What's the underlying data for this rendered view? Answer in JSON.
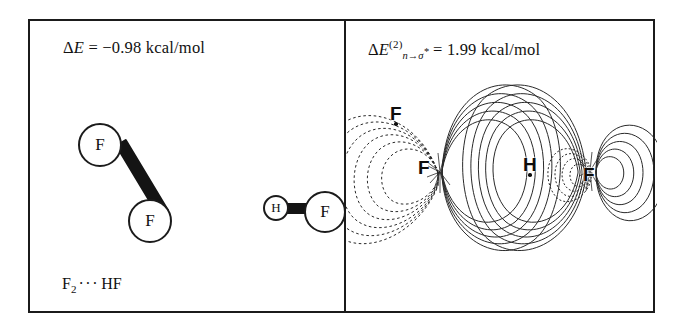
{
  "figure": {
    "system": "F2---HF",
    "panels": [
      {
        "id": "ball-and-stick",
        "energy_label": {
          "symbol": "E",
          "delta": "Δ",
          "equals": "=",
          "value": "−0.98",
          "units": "kcal/mol",
          "full_text": "ΔE = −0.98 kcal/mol"
        },
        "caption": {
          "formula_first": "F",
          "formula_sub": "2",
          "dots": "···",
          "formula_second": "HF",
          "full_text": "F2 ··· HF"
        },
        "molecules": [
          {
            "name": "difluorine",
            "atoms": [
              {
                "label": "F",
                "role": "fluorine-upper"
              },
              {
                "label": "F",
                "role": "fluorine-lower"
              }
            ],
            "bond": "single"
          },
          {
            "name": "hydrogen-fluoride",
            "atoms": [
              {
                "label": "H",
                "role": "hydrogen"
              },
              {
                "label": "F",
                "role": "fluorine"
              }
            ],
            "bond": "single"
          }
        ]
      },
      {
        "id": "orbital-overlap",
        "energy_label": {
          "delta": "Δ",
          "symbol": "E",
          "superscript": "(2)",
          "subscript_from": "n",
          "subscript_arrow": "→",
          "subscript_to": "σ",
          "subscript_star": "*",
          "equals": "=",
          "value": "1.99",
          "units": "kcal/mol",
          "full_text": "ΔE(2) n→σ* = 1.99 kcal/mol"
        },
        "atom_labels": [
          {
            "label": "F",
            "position": "upper-left-out-of-plane"
          },
          {
            "label": "F",
            "position": "left-donor"
          },
          {
            "label": "H",
            "position": "center"
          },
          {
            "label": "F",
            "position": "right-acceptor"
          }
        ],
        "contours": {
          "description": "NBO orbital overlap contour diagram",
          "positive_phase_style": "solid",
          "negative_phase_style": "dashed",
          "line_color": "#2a2a2a"
        }
      }
    ],
    "frame": {
      "border_color": "#1b1b1b",
      "divider": "vertical"
    }
  }
}
